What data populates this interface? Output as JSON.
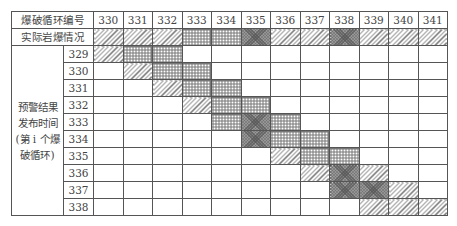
{
  "table": {
    "header_label": "爆破循环编号",
    "actual_label": "实际岩爆情况",
    "side_label": "预警结果发布时间(第i个爆破循环)",
    "side_label_lines": [
      "预警结果",
      "发布时间",
      "(第 i 个爆",
      "破循环)"
    ],
    "columns": [
      "330",
      "331",
      "332",
      "333",
      "334",
      "335",
      "336",
      "337",
      "338",
      "339",
      "340",
      "341"
    ],
    "actual_patterns": [
      "D",
      "D",
      "D",
      "G",
      "G",
      "C",
      "D",
      "D",
      "C",
      "D",
      "D",
      "D"
    ],
    "rows": [
      {
        "label": "329",
        "cells": [
          "D",
          "G",
          "G",
          "",
          "",
          "",
          "",
          "",
          "",
          "",
          "",
          ""
        ]
      },
      {
        "label": "330",
        "cells": [
          "",
          "D",
          "G",
          "G",
          "",
          "",
          "",
          "",
          "",
          "",
          "",
          ""
        ]
      },
      {
        "label": "331",
        "cells": [
          "",
          "",
          "D",
          "G",
          "G",
          "",
          "",
          "",
          "",
          "",
          "",
          ""
        ]
      },
      {
        "label": "332",
        "cells": [
          "",
          "",
          "",
          "D",
          "G",
          "G",
          "",
          "",
          "",
          "",
          "",
          ""
        ]
      },
      {
        "label": "333",
        "cells": [
          "",
          "",
          "",
          "",
          "G",
          "C",
          "G",
          "",
          "",
          "",
          "",
          ""
        ]
      },
      {
        "label": "334",
        "cells": [
          "",
          "",
          "",
          "",
          "",
          "C",
          "G",
          "G",
          "",
          "",
          "",
          ""
        ]
      },
      {
        "label": "335",
        "cells": [
          "",
          "",
          "",
          "",
          "",
          "",
          "D",
          "G",
          "G",
          "",
          "",
          ""
        ]
      },
      {
        "label": "336",
        "cells": [
          "",
          "",
          "",
          "",
          "",
          "",
          "",
          "D",
          "C",
          "D",
          "",
          ""
        ]
      },
      {
        "label": "337",
        "cells": [
          "",
          "",
          "",
          "",
          "",
          "",
          "",
          "",
          "C",
          "C",
          "D",
          ""
        ]
      },
      {
        "label": "338",
        "cells": [
          "",
          "",
          "",
          "",
          "",
          "",
          "",
          "",
          "",
          "D",
          "D",
          "D"
        ]
      }
    ],
    "pattern_legend": {
      "D": "diagonal-hatch",
      "G": "square-grid",
      "C": "dense-checker",
      "": "empty"
    }
  }
}
